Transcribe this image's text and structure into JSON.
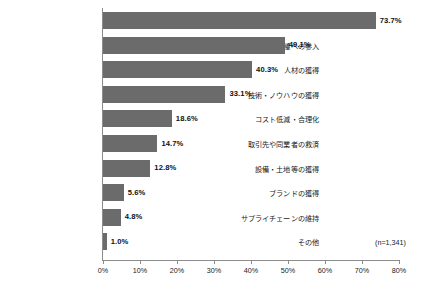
{
  "chart_data": {
    "type": "bar",
    "orientation": "horizontal",
    "title": "",
    "xlabel": "",
    "ylabel": "",
    "xlim": [
      0,
      80
    ],
    "xticks": [
      "0%",
      "10%",
      "20%",
      "30%",
      "40%",
      "50%",
      "60%",
      "70%",
      "80%"
    ],
    "xtick_values": [
      0,
      10,
      20,
      30,
      40,
      50,
      60,
      70,
      80
    ],
    "grid": false,
    "legend": false,
    "bar_color": "#6b6b6b",
    "axis_color": "#8c8c8c",
    "categories": [
      "売上・市場シェアの拡大",
      "新事業展開・異業種への参入",
      "人材の獲得",
      "技術・ノウハウの獲得",
      "コスト低減・合理化",
      "取引先や同業者の救済",
      "設備・土地等の獲得",
      "ブランドの獲得",
      "サプライチェーンの維持",
      "その他"
    ],
    "values": [
      73.7,
      49.1,
      40.3,
      33.1,
      18.6,
      14.7,
      12.8,
      5.6,
      4.8,
      1.0
    ],
    "value_labels": [
      "73.7%",
      "49.1%",
      "40.3%",
      "33.1%",
      "18.6%",
      "14.7%",
      "12.8%",
      "5.6%",
      "4.8%",
      "1.0%"
    ],
    "annotation": "(n=1,341)"
  }
}
